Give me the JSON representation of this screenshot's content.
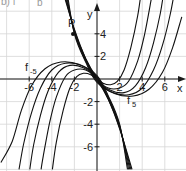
{
  "caption": {
    "left": "b) f",
    "right": "b"
  },
  "labels": {
    "x_axis": "x",
    "y_axis": "y",
    "point": "P",
    "family_left": {
      "base": "f",
      "sub": "-5"
    },
    "family_right": {
      "base": "f",
      "sub": "5"
    }
  },
  "chart_data": {
    "type": "line",
    "title": "",
    "xlabel": "x",
    "ylabel": "y",
    "xlim": [
      -8.5,
      7.5
    ],
    "ylim": [
      -8,
      7
    ],
    "grid": true,
    "grid_step": 2,
    "x_ticks": [
      -6,
      -4,
      -2,
      2,
      4,
      6
    ],
    "y_ticks": [
      -6,
      -4,
      -2,
      2,
      4
    ],
    "annotations": [
      {
        "text": "P",
        "x": -2.1,
        "y": 4.0,
        "marker": "dot"
      },
      {
        "text": "f_-5",
        "x": -5.9,
        "y": 1.0
      },
      {
        "text": "f_5",
        "x": 2.9,
        "y": -2.2
      }
    ],
    "series": [
      {
        "name": "f_1",
        "points": [
          [
            -3.1,
            8
          ],
          [
            -2.0,
            4.4
          ],
          [
            -1.0,
            1.8
          ],
          [
            0,
            0.1
          ],
          [
            0.6,
            -0.4
          ],
          [
            1.2,
            -0.5
          ],
          [
            1.8,
            -0.2
          ],
          [
            2.4,
            0.8
          ],
          [
            3.0,
            2.8
          ],
          [
            3.6,
            5.6
          ],
          [
            3.95,
            8
          ]
        ]
      },
      {
        "name": "f_2",
        "points": [
          [
            -3.0,
            8
          ],
          [
            -2.0,
            4.3
          ],
          [
            -1.0,
            1.8
          ],
          [
            0,
            0.0
          ],
          [
            1.0,
            -0.8
          ],
          [
            2.0,
            -0.8
          ],
          [
            2.8,
            -0.2
          ],
          [
            3.6,
            1.6
          ],
          [
            4.2,
            3.9
          ],
          [
            4.75,
            6.8
          ],
          [
            4.95,
            8
          ]
        ]
      },
      {
        "name": "f_3",
        "points": [
          [
            -2.9,
            8
          ],
          [
            -2.0,
            4.2
          ],
          [
            -1.0,
            1.7
          ],
          [
            0,
            -0.1
          ],
          [
            1.2,
            -1.0
          ],
          [
            2.4,
            -1.2
          ],
          [
            3.4,
            -0.6
          ],
          [
            4.3,
            1.0
          ],
          [
            5.0,
            3.2
          ],
          [
            5.6,
            5.8
          ],
          [
            5.95,
            8
          ]
        ]
      },
      {
        "name": "f_4",
        "points": [
          [
            -2.8,
            8
          ],
          [
            -2.0,
            4.1
          ],
          [
            -1.0,
            1.6
          ],
          [
            0,
            -0.2
          ],
          [
            1.4,
            -1.2
          ],
          [
            2.8,
            -1.4
          ],
          [
            4.0,
            -0.8
          ],
          [
            5.0,
            0.8
          ],
          [
            5.8,
            3.0
          ],
          [
            6.5,
            5.8
          ],
          [
            6.9,
            8
          ]
        ]
      },
      {
        "name": "f_5",
        "points": [
          [
            -2.7,
            8
          ],
          [
            -2.0,
            4.0
          ],
          [
            -1.0,
            1.5
          ],
          [
            0,
            -0.3
          ],
          [
            1.6,
            -1.3
          ],
          [
            3.2,
            -1.5
          ],
          [
            4.6,
            -0.9
          ],
          [
            5.8,
            0.6
          ],
          [
            6.7,
            2.8
          ],
          [
            7.5,
            5.5
          ]
        ]
      },
      {
        "name": "f_-1",
        "points": [
          [
            -3.95,
            -8
          ],
          [
            -3.6,
            -5.6
          ],
          [
            -3.0,
            -2.8
          ],
          [
            -2.4,
            -0.8
          ],
          [
            -1.8,
            0.2
          ],
          [
            -1.2,
            0.5
          ],
          [
            -0.6,
            0.4
          ],
          [
            0,
            -0.1
          ],
          [
            1.0,
            -1.8
          ],
          [
            2.0,
            -4.4
          ],
          [
            3.1,
            -8
          ]
        ]
      },
      {
        "name": "f_-2",
        "points": [
          [
            -4.95,
            -8
          ],
          [
            -4.75,
            -6.8
          ],
          [
            -4.2,
            -3.9
          ],
          [
            -3.6,
            -1.6
          ],
          [
            -2.8,
            0.2
          ],
          [
            -2.0,
            0.8
          ],
          [
            -1.0,
            0.8
          ],
          [
            0,
            0.0
          ],
          [
            1.0,
            -1.8
          ],
          [
            2.0,
            -4.3
          ],
          [
            3.0,
            -8
          ]
        ]
      },
      {
        "name": "f_-3",
        "points": [
          [
            -5.95,
            -8
          ],
          [
            -5.6,
            -5.8
          ],
          [
            -5.0,
            -3.2
          ],
          [
            -4.3,
            -1.0
          ],
          [
            -3.4,
            0.6
          ],
          [
            -2.4,
            1.2
          ],
          [
            -1.2,
            1.0
          ],
          [
            0,
            0.1
          ],
          [
            1.0,
            -1.7
          ],
          [
            2.0,
            -4.2
          ],
          [
            2.9,
            -8
          ]
        ]
      },
      {
        "name": "f_-4",
        "points": [
          [
            -6.9,
            -8
          ],
          [
            -6.5,
            -5.8
          ],
          [
            -5.8,
            -3.0
          ],
          [
            -5.0,
            -0.8
          ],
          [
            -4.0,
            0.8
          ],
          [
            -2.8,
            1.4
          ],
          [
            -1.4,
            1.2
          ],
          [
            0,
            0.2
          ],
          [
            1.0,
            -1.6
          ],
          [
            2.0,
            -4.1
          ],
          [
            2.8,
            -8
          ]
        ]
      },
      {
        "name": "f_-5",
        "points": [
          [
            -8.5,
            -7.4
          ],
          [
            -7.5,
            -5.5
          ],
          [
            -6.7,
            -2.8
          ],
          [
            -5.8,
            -0.6
          ],
          [
            -4.6,
            0.9
          ],
          [
            -3.2,
            1.5
          ],
          [
            -1.6,
            1.3
          ],
          [
            0,
            0.3
          ],
          [
            1.0,
            -1.5
          ],
          [
            2.0,
            -4.0
          ],
          [
            2.7,
            -8
          ]
        ]
      }
    ]
  }
}
